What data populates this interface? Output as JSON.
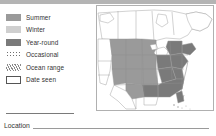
{
  "topbar": {
    "color": "#b4b4b4"
  },
  "legend": {
    "items": [
      {
        "label": "Summer",
        "swatch": "solid-mid-gray",
        "color": "#9a9a9a",
        "icon": "legend-swatch-summer-icon"
      },
      {
        "label": "Winter",
        "swatch": "solid-light-gray",
        "color": "#cfcfcf",
        "icon": "legend-swatch-winter-icon"
      },
      {
        "label": "Year-round",
        "swatch": "solid-dark-gray",
        "color": "#7a7a7a",
        "icon": "legend-swatch-year-round-icon"
      },
      {
        "label": "Occasional",
        "swatch": "dotted",
        "color": "#6f6f6f",
        "icon": "legend-swatch-occasional-icon"
      },
      {
        "label": "Ocean range",
        "swatch": "diagonal-hatch",
        "color": "#8a8a8a",
        "icon": "legend-swatch-ocean-range-icon"
      },
      {
        "label": "Date seen",
        "swatch": "empty-box",
        "color": "#555555",
        "icon": "legend-swatch-date-seen-icon"
      }
    ]
  },
  "form": {
    "location_label": "Location",
    "location_value": ""
  },
  "map": {
    "name": "north-america-range-map",
    "region": "North America",
    "land_color": "#ffffff",
    "border_color": "#9b9b9b",
    "summer_color": "#9a9a9a",
    "year_round_color": "#7a7a7a",
    "winter_color": "#cfcfcf",
    "frame_color": "#b0b0b0"
  }
}
